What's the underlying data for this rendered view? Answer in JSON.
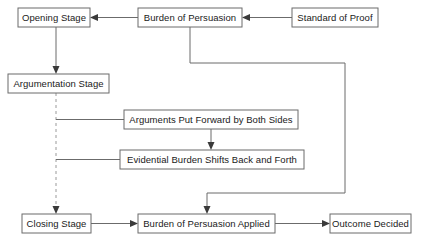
{
  "diagram": {
    "type": "flowchart",
    "background_color": "#ffffff",
    "box_border_color": "#6b6b6b",
    "line_color": "#6b6b6b",
    "dashed_line_color": "#9a9a9a",
    "text_color": "#1a1a1a",
    "nodes": [
      {
        "id": "opening-stage",
        "label": "Opening Stage",
        "x": 18,
        "y": 8,
        "w": 72,
        "h": 19
      },
      {
        "id": "burden-of-persuasion",
        "label": "Burden of Persuasion",
        "x": 138,
        "y": 8,
        "w": 104,
        "h": 19
      },
      {
        "id": "standard-of-proof",
        "label": "Standard of Proof",
        "x": 292,
        "y": 8,
        "w": 86,
        "h": 19
      },
      {
        "id": "argumentation-stage",
        "label": "Argumentation Stage",
        "x": 8,
        "y": 74,
        "w": 101,
        "h": 19
      },
      {
        "id": "arguments-put-forward",
        "label": "Arguments Put Forward by Both Sides",
        "x": 124,
        "y": 110,
        "w": 174,
        "h": 19
      },
      {
        "id": "evidential-burden",
        "label": "Evidential Burden Shifts Back and Forth",
        "x": 120,
        "y": 150,
        "w": 184,
        "h": 19
      },
      {
        "id": "closing-stage",
        "label": "Closing Stage",
        "x": 22,
        "y": 214,
        "w": 69,
        "h": 19
      },
      {
        "id": "burden-applied",
        "label": "Burden of Persuasion Applied",
        "x": 138,
        "y": 214,
        "w": 137,
        "h": 19
      },
      {
        "id": "outcome-decided",
        "label": "Outcome Decided",
        "x": 330,
        "y": 214,
        "w": 81,
        "h": 19
      }
    ],
    "edges": [
      {
        "id": "standard-to-burden",
        "from": "standard-of-proof",
        "to": "burden-of-persuasion",
        "style": "solid",
        "arrow": "left"
      },
      {
        "id": "burden-to-opening",
        "from": "burden-of-persuasion",
        "to": "opening-stage",
        "style": "solid",
        "arrow": "left"
      },
      {
        "id": "opening-to-argumentation",
        "from": "opening-stage",
        "to": "argumentation-stage",
        "style": "solid",
        "arrow": "down"
      },
      {
        "id": "argumentation-to-closing",
        "from": "argumentation-stage",
        "to": "closing-stage",
        "style": "dashed",
        "arrow": "down"
      },
      {
        "id": "spine-to-arguments",
        "from": "argumentation-stage",
        "to": "arguments-put-forward",
        "style": "solid",
        "arrow": "none"
      },
      {
        "id": "spine-to-evidential",
        "from": "argumentation-stage",
        "to": "evidential-burden",
        "style": "solid",
        "arrow": "none"
      },
      {
        "id": "arguments-to-evidential",
        "from": "arguments-put-forward",
        "to": "evidential-burden",
        "style": "solid",
        "arrow": "down"
      },
      {
        "id": "burden-to-applied",
        "from": "burden-of-persuasion",
        "to": "burden-applied",
        "style": "solid",
        "arrow": "down"
      },
      {
        "id": "closing-to-applied",
        "from": "closing-stage",
        "to": "burden-applied",
        "style": "solid",
        "arrow": "right"
      },
      {
        "id": "applied-to-outcome",
        "from": "burden-applied",
        "to": "outcome-decided",
        "style": "solid",
        "arrow": "right"
      }
    ]
  }
}
